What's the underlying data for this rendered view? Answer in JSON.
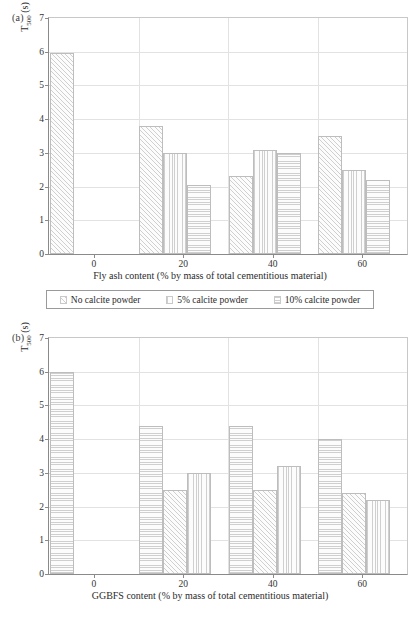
{
  "figure": {
    "panels": [
      {
        "tag": "(a)",
        "legend": [
          {
            "label": "No calcite powder",
            "pattern": "diagonal"
          },
          {
            "label": "5% calcite powder",
            "pattern": "vertical"
          },
          {
            "label": "10% calcite powder",
            "pattern": "horizontal"
          }
        ],
        "chart_data": {
          "type": "bar",
          "title": "",
          "xlabel": "Fly ash content (% by mass of total cementitious material)",
          "ylabel": "T500 (s)",
          "ylabel_base": "T",
          "ylabel_sub": "500",
          "ylabel_unit": " (s)",
          "categories": [
            "0",
            "20",
            "40",
            "60"
          ],
          "xticks": [
            "0",
            "20",
            "40",
            "60"
          ],
          "yticks": [
            "0",
            "1",
            "2",
            "3",
            "4",
            "5",
            "6",
            "7"
          ],
          "ylim": [
            0,
            7
          ],
          "grid": true,
          "legend_position": "below",
          "series": [
            {
              "name": "No calcite powder",
              "pattern": "diagonal",
              "values": [
                5.95,
                3.8,
                2.3,
                3.5
              ]
            },
            {
              "name": "5% calcite powder",
              "pattern": "vertical",
              "values": [
                null,
                3.0,
                3.1,
                2.5
              ]
            },
            {
              "name": "10% calcite powder",
              "pattern": "horizontal",
              "values": [
                null,
                2.05,
                3.0,
                2.2
              ]
            }
          ]
        }
      },
      {
        "tag": "(b)",
        "legend": [
          {
            "label": "No calcite powder",
            "pattern": "horizontal"
          },
          {
            "label": "5% calcite powder",
            "pattern": "diagonal"
          },
          {
            "label": "10% calcite powder",
            "pattern": "vertical"
          }
        ],
        "chart_data": {
          "type": "bar",
          "title": "",
          "xlabel": "GGBFS content (% by mass of total cementitious material)",
          "ylabel": "T500 (s)",
          "ylabel_base": "T",
          "ylabel_sub": "500",
          "ylabel_unit": " (s)",
          "categories": [
            "0",
            "20",
            "40",
            "60"
          ],
          "xticks": [
            "0",
            "20",
            "40",
            "60"
          ],
          "yticks": [
            "0",
            "1",
            "2",
            "3",
            "4",
            "5",
            "6",
            "7"
          ],
          "ylim": [
            0,
            7
          ],
          "grid": true,
          "legend_position": "below",
          "series": [
            {
              "name": "No calcite powder",
              "pattern": "horizontal",
              "values": [
                6.0,
                4.4,
                4.4,
                4.0
              ]
            },
            {
              "name": "5% calcite powder",
              "pattern": "diagonal",
              "values": [
                null,
                2.5,
                2.5,
                2.4
              ]
            },
            {
              "name": "10% calcite powder",
              "pattern": "vertical",
              "values": [
                null,
                3.0,
                3.2,
                2.2
              ]
            }
          ]
        }
      }
    ],
    "colors": {
      "axis": "#8a8a8a",
      "grid": "#e2e2e2",
      "bar_edge": "#bdbdbd",
      "hatch": "#cfcfcf",
      "text": "#2b2b2b"
    }
  }
}
